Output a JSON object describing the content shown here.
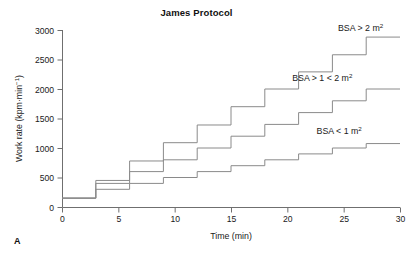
{
  "figure": {
    "panel_label": "A",
    "title": "James Protocol"
  },
  "chart_data": {
    "type": "line",
    "title": "James Protocol",
    "xlabel": "Time (min)",
    "ylabel": "Work rate (kpm·min⁻¹)",
    "ylabel_parts": {
      "main": "Work rate (kpm·min",
      "sup": "−1",
      "tail": ")"
    },
    "xlim": [
      0,
      30
    ],
    "ylim": [
      0,
      3000
    ],
    "xticks": [
      0,
      5,
      10,
      15,
      20,
      25,
      30
    ],
    "yticks": [
      0,
      500,
      1000,
      1500,
      2000,
      2500,
      3000
    ],
    "xtick_labels": [
      "0",
      "5",
      "10",
      "15",
      "20",
      "25",
      "30"
    ],
    "ytick_labels": [
      "0",
      "500",
      "1000",
      "1500",
      "2000",
      "2500",
      "3000"
    ],
    "grid": false,
    "legend_position": "inline-right",
    "step_style": "post",
    "step_duration_min": 3,
    "line_color": "#8a8a8a",
    "axis_color": "#6f6f6f",
    "series": [
      {
        "name": "BSA > 2 m2",
        "label_main": "BSA > 2 m",
        "label_sup": "2",
        "label_x": 26.5,
        "label_y": 2980,
        "x": [
          0,
          3,
          6,
          9,
          12,
          15,
          18,
          21,
          24,
          27,
          30
        ],
        "values": [
          150,
          450,
          780,
          1090,
          1390,
          1700,
          2000,
          2290,
          2580,
          2880,
          2880
        ]
      },
      {
        "name": "BSA > 1 < 2 m2",
        "label_main": "BSA > 1 < 2 m",
        "label_sup": "2",
        "label_x": 23.1,
        "label_y": 2130,
        "x": [
          0,
          3,
          6,
          9,
          12,
          15,
          18,
          21,
          24,
          27,
          30
        ],
        "values": [
          150,
          400,
          600,
          800,
          1000,
          1200,
          1400,
          1600,
          1800,
          2000,
          2000
        ]
      },
      {
        "name": "BSA < 1 m2",
        "label_main": "BSA < 1 m",
        "label_sup": "2",
        "label_x": 24.6,
        "label_y": 1230,
        "x": [
          0,
          3,
          6,
          9,
          12,
          15,
          18,
          21,
          24,
          27,
          30
        ],
        "values": [
          150,
          300,
          400,
          500,
          600,
          700,
          800,
          900,
          1000,
          1075,
          1075
        ]
      }
    ]
  }
}
